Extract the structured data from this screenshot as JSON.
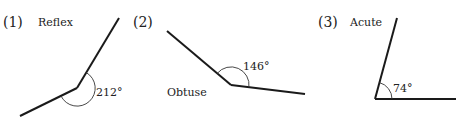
{
  "figures": [
    {
      "index_label": "(1)",
      "type_label": "Reflex",
      "angle_label": "212°",
      "angle_degrees": 212,
      "vertex": [
        77,
        88
      ],
      "arm_a_end": [
        119,
        18
      ],
      "arm_b_end": [
        20,
        116
      ]
    },
    {
      "index_label": "(2)",
      "type_label": "Obtuse",
      "angle_label": "146°",
      "angle_degrees": 146,
      "vertex": [
        231,
        85
      ],
      "arm_a_end": [
        167,
        31
      ],
      "arm_b_end": [
        305,
        94
      ]
    },
    {
      "index_label": "(3)",
      "type_label": "Acute",
      "angle_label": "74°",
      "angle_degrees": 74,
      "vertex": [
        375,
        99
      ],
      "arm_a_end": [
        397,
        18
      ],
      "arm_b_end": [
        456,
        99
      ]
    }
  ]
}
